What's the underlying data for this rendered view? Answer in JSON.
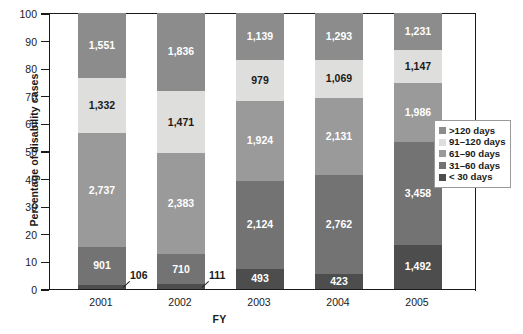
{
  "chart_data": {
    "type": "bar",
    "stacked": true,
    "stack_mode": "percent",
    "title": "",
    "xlabel": "FY",
    "ylabel": "Percentage of disability cases",
    "categories": [
      "2001",
      "2002",
      "2003",
      "2004",
      "2005"
    ],
    "ylim": [
      0,
      100
    ],
    "yticks": [
      0,
      10,
      20,
      30,
      40,
      50,
      60,
      70,
      80,
      90,
      100
    ],
    "ytick_labels": [
      "0",
      "10",
      "20",
      "30",
      "40",
      "50",
      "60",
      "70",
      "80",
      "90",
      "100"
    ],
    "grid": false,
    "legend_position": "right-middle",
    "series": [
      {
        "name": "< 30 days",
        "color": "#4d4d4d",
        "values": [
          106,
          111,
          493,
          423,
          1492
        ],
        "labels": [
          "106",
          "111",
          "493",
          "423",
          "1,492"
        ],
        "percent": [
          1.6,
          1.7,
          7.4,
          5.5,
          16.0
        ]
      },
      {
        "name": "31–60 days",
        "color": "#737373",
        "values": [
          901,
          710,
          2124,
          2762,
          3458
        ],
        "labels": [
          "901",
          "710",
          "2,124",
          "2,762",
          "3,458"
        ],
        "percent": [
          13.6,
          10.9,
          31.9,
          36.0,
          37.1
        ]
      },
      {
        "name": "61–90 days",
        "color": "#9a9a9a",
        "values": [
          2737,
          2383,
          1924,
          2131,
          1986
        ],
        "labels": [
          "2,737",
          "2,383",
          "1,924",
          "2,131",
          "1,986"
        ],
        "percent": [
          41.3,
          36.6,
          28.9,
          27.8,
          21.3
        ]
      },
      {
        "name": "91–120 days",
        "color": "#dededc",
        "values": [
          1332,
          1471,
          979,
          1069,
          1147
        ],
        "labels": [
          "1,332",
          "1,471",
          "979",
          "1,069",
          "1,147"
        ],
        "percent": [
          20.1,
          22.6,
          14.7,
          13.9,
          12.3
        ]
      },
      {
        "name": ">120 days",
        "color": "#8c8c8c",
        "values": [
          1551,
          1836,
          1139,
          1293,
          1231
        ],
        "labels": [
          "1,551",
          "1,836",
          "1,139",
          "1,293",
          "1,231"
        ],
        "percent": [
          23.4,
          28.2,
          17.1,
          16.8,
          13.2
        ]
      }
    ],
    "totals": [
      6627,
      6511,
      6659,
      7678,
      9314
    ],
    "callouts": [
      {
        "label": "106",
        "category": "2001"
      },
      {
        "label": "111",
        "category": "2002"
      }
    ]
  },
  "legend": {
    "items": [
      {
        "label": ">120 days",
        "color": "#8c8c8c"
      },
      {
        "label": "91–120 days",
        "color": "#dededc"
      },
      {
        "label": "61–90 days",
        "color": "#9a9a9a"
      },
      {
        "label": "31–60 days",
        "color": "#737373"
      },
      {
        "label": "< 30 days",
        "color": "#4d4d4d"
      }
    ]
  },
  "axes": {
    "y_title": "Percentage of disability cases",
    "x_title": "FY"
  }
}
